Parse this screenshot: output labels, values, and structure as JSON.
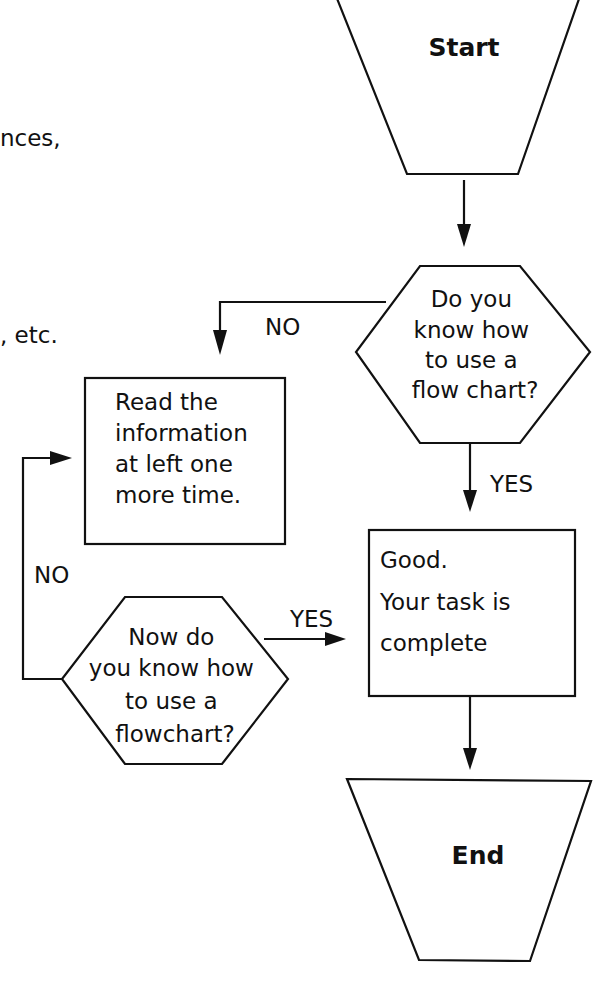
{
  "left_text_fragments": [
    {
      "text": "nces,"
    },
    {
      "text": ", etc."
    }
  ],
  "flowchart": {
    "start": {
      "label": "Start",
      "shape": "trapezoid"
    },
    "decision_1": {
      "lines": [
        "Do you",
        "know how",
        "to use a",
        "flow chart?"
      ],
      "shape": "hexagon"
    },
    "process_reread": {
      "lines": [
        "Read the",
        "information",
        "at left one",
        "more time."
      ],
      "shape": "rectangle"
    },
    "decision_2": {
      "lines": [
        "Now do",
        "you know how",
        "to use a",
        "flowchart?"
      ],
      "shape": "hexagon"
    },
    "process_good": {
      "lines": [
        "Good.",
        "Your task is",
        "complete"
      ],
      "shape": "rectangle"
    },
    "end": {
      "label": "End",
      "shape": "trapezoid"
    },
    "edges": [
      {
        "from": "start",
        "to": "decision_1",
        "label": ""
      },
      {
        "from": "decision_1",
        "to": "process_reread",
        "label": "NO"
      },
      {
        "from": "decision_1",
        "to": "process_good",
        "label": "YES"
      },
      {
        "from": "decision_2",
        "to": "process_reread",
        "label": "NO"
      },
      {
        "from": "decision_2",
        "to": "process_good",
        "label": "YES"
      },
      {
        "from": "process_good",
        "to": "end",
        "label": ""
      }
    ]
  },
  "colors": {
    "ink": "#111111",
    "background": "#ffffff"
  }
}
